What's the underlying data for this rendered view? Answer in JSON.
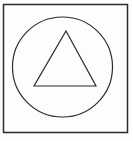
{
  "figure": {
    "background_color": "#fdfdfc",
    "stroke_color": "#2b2b2b",
    "canvas": {
      "width": 133,
      "height": 141
    },
    "shapes": {
      "square": {
        "name": "outer-square-frame",
        "x": 3.5,
        "y": 4.5,
        "width": 124,
        "height": 128,
        "stroke_width": 1.5
      },
      "circle": {
        "name": "inscribed-circle",
        "cx": 62.5,
        "cy": 67,
        "r": 50,
        "stroke_width": 1.2
      },
      "triangle": {
        "name": "inscribed-triangle",
        "points": "66,31 96,86 34,86",
        "apex": {
          "x": 66,
          "y": 31
        },
        "base_left": {
          "x": 34,
          "y": 86
        },
        "base_right": {
          "x": 96,
          "y": 86
        },
        "stroke_width": 1.2
      }
    }
  }
}
